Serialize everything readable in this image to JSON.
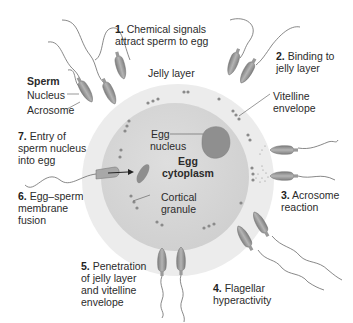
{
  "diagram": {
    "colors": {
      "jelly_layer": "#ececec",
      "cytoplasm": "#d6d6d6",
      "granule": "#8a8a8a",
      "sperm_head": "#9a9a9a",
      "text": "#2b2b2b"
    },
    "sperm_legend": {
      "title": "Sperm",
      "nucleus": "Nucleus",
      "acrosome": "Acrosome"
    },
    "structures": {
      "jelly_layer": "Jelly layer",
      "vitelline_envelope_1": "Vitelline",
      "vitelline_envelope_2": "envelope",
      "egg_nucleus_1": "Egg",
      "egg_nucleus_2": "nucleus",
      "egg_cytoplasm_1": "Egg",
      "egg_cytoplasm_2": "cytoplasm",
      "cortical_granule_1": "Cortical",
      "cortical_granule_2": "granule"
    },
    "steps": [
      {
        "num": "1.",
        "lines": [
          "Chemical signals",
          "attract sperm to egg"
        ]
      },
      {
        "num": "2.",
        "lines": [
          "Binding to",
          "jelly layer"
        ]
      },
      {
        "num": "3.",
        "lines": [
          "Acrosome",
          "reaction"
        ]
      },
      {
        "num": "4.",
        "lines": [
          "Flagellar",
          "hyperactivity"
        ]
      },
      {
        "num": "5.",
        "lines": [
          "Penetration",
          "of jelly layer",
          "and vitelline",
          "envelope"
        ]
      },
      {
        "num": "6.",
        "lines": [
          "Egg–sperm",
          "membrane",
          "fusion"
        ]
      },
      {
        "num": "7.",
        "lines": [
          "Entry of",
          "sperm nucleus",
          "into egg"
        ]
      }
    ]
  }
}
